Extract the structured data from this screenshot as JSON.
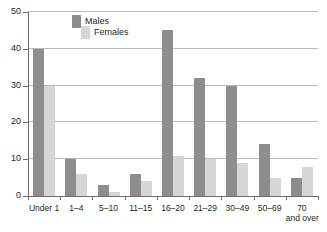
{
  "chart_data": {
    "type": "bar",
    "title": "",
    "subtitle": "",
    "xlabel": "",
    "ylabel": "",
    "ylim": [
      0,
      50
    ],
    "yticks": [
      0,
      10,
      20,
      30,
      40,
      50
    ],
    "ytick_labels": [
      "0",
      "10",
      "20",
      "30",
      "40",
      "50"
    ],
    "grid": true,
    "grid_axis": "y",
    "legend_position": "top-left-inside",
    "categories": [
      "Under 1",
      "1–4",
      "5–10",
      "11–15",
      "16–20",
      "21–29",
      "30–49",
      "50–69",
      "70 and over"
    ],
    "category_lines": [
      [
        "Under 1"
      ],
      [
        "1–4"
      ],
      [
        "5–10"
      ],
      [
        "11–15"
      ],
      [
        "16–20"
      ],
      [
        "21–29"
      ],
      [
        "30–49"
      ],
      [
        "50–69"
      ],
      [
        "70",
        "and over"
      ]
    ],
    "series": [
      {
        "name": "Males",
        "color": "#8d8d8d",
        "values": [
          40,
          10,
          3,
          6,
          45,
          32,
          30,
          14,
          5
        ]
      },
      {
        "name": "Females",
        "color": "#d6d6d6",
        "values": [
          30,
          6,
          1,
          4,
          11,
          10,
          9,
          5,
          8
        ]
      }
    ]
  },
  "legend": {
    "items": [
      {
        "label": "Males",
        "color": "#8d8d8d"
      },
      {
        "label": "Females",
        "color": "#d6d6d6"
      }
    ]
  },
  "colors": {
    "males": "#8d8d8d",
    "females": "#d6d6d6",
    "axis": "#6e6e6e",
    "grid": "#b9b9b9",
    "text": "#231f20",
    "background": "#ffffff"
  }
}
